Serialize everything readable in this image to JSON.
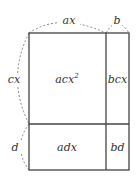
{
  "diagram": {
    "type": "area-model",
    "colors": {
      "line": "#444444",
      "dash": "#888888",
      "text": "#333333"
    },
    "dimensions": {
      "top_left": "ax",
      "top_right": "b",
      "left_top": "cx",
      "left_bottom": "d"
    },
    "cells": {
      "top_left": {
        "base": "acx",
        "exp": "2"
      },
      "top_right": "bcx",
      "bottom_left": "adx",
      "bottom_right": "bd"
    }
  }
}
